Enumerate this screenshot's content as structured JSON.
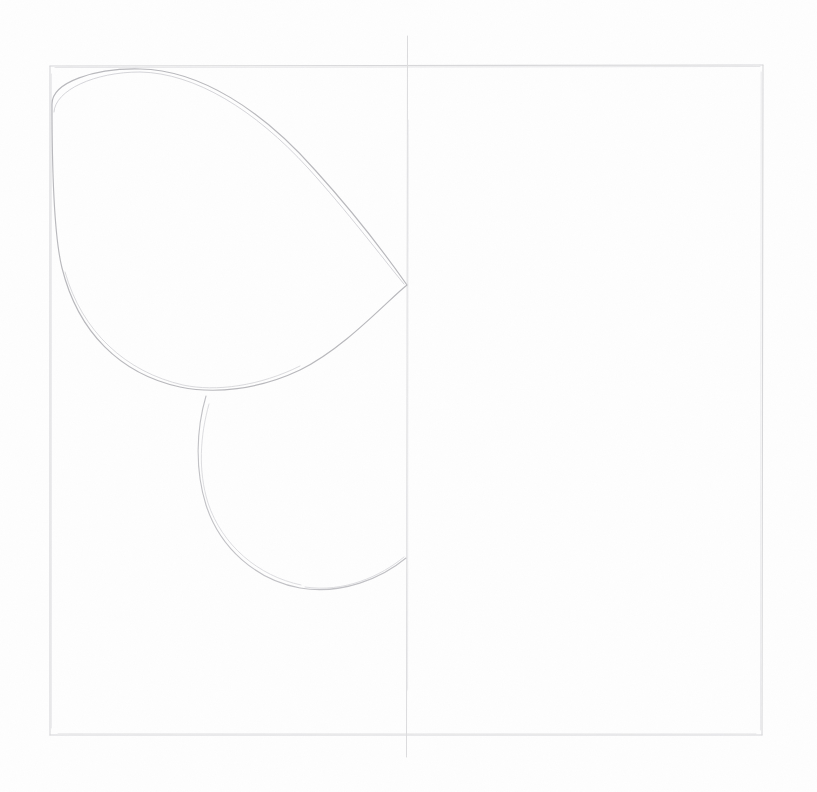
{
  "document": {
    "title": "Pencil Construction Sketch",
    "medium": "graphite pencil on white paper",
    "canvas_width": 817,
    "canvas_height": 792,
    "background_color": "#fefefe"
  },
  "palette": {
    "paper": "#fefefe",
    "frame_stroke": "#d8d8da",
    "axis_stroke": "#dcdcde",
    "shape_stroke": "#b9b9bd",
    "shape_stroke_light": "#cdcdd1"
  },
  "frame": {
    "name": "border-rectangle",
    "left": 50,
    "top": 66,
    "right": 763,
    "bottom": 735,
    "stroke_width": 1.1,
    "stroke_color": "#d8d8da"
  },
  "center_axis": {
    "name": "vertical-center-line",
    "x": 407,
    "y_start": 36,
    "y_end": 757,
    "stroke_width": 1,
    "stroke_color": "#dcdcde"
  },
  "shapes": [
    {
      "name": "egg-shape",
      "type": "teardrop",
      "description": "large egg / teardrop outline in upper-left quadrant, apex pointing right to the center axis",
      "apex_x": 407,
      "apex_y": 285,
      "top_y": 70,
      "left_x": 52,
      "bottom_y": 389,
      "stroke_color": "#b9b9bd",
      "stroke_width": 1.15,
      "path": "M 52,104 C 52,82 95,68 140,69 C 200,70 262,110 315,170 C 355,214 388,258 407,285 C 388,300 345,348 300,370 C 258,390 214,394 180,387 C 120,374 78,332 62,268 C 54,236 52,160 52,104 Z"
    },
    {
      "name": "lower-circle-shape",
      "type": "circle-arc",
      "description": "circular outline below the egg, right side terminating on the center axis",
      "left_x": 205,
      "bottom_y": 589,
      "top_y": 392,
      "right_anchor_x": 406,
      "right_anchor_y": 558,
      "stroke_color": "#c2c2c6",
      "stroke_width": 1.1,
      "path": "M 206,396 C 196,430 195,470 206,505 C 220,548 256,580 300,588 C 342,595 382,578 406,558"
    }
  ],
  "annotations": {
    "visible_text": "",
    "labels": []
  }
}
